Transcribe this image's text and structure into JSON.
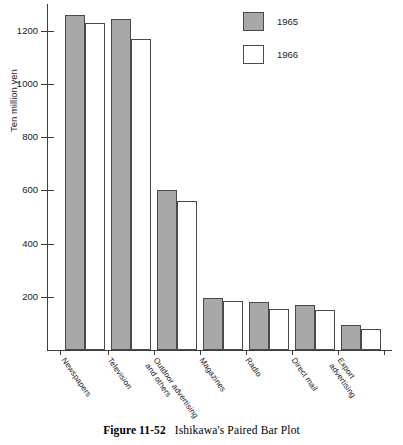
{
  "chart_data": {
    "type": "bar",
    "title": "",
    "xlabel": "",
    "ylabel": "Ten million yen",
    "ylim": [
      0,
      1300
    ],
    "grid": false,
    "legend_position": "top-right",
    "y_ticks": [
      200,
      400,
      600,
      800,
      1000,
      1200
    ],
    "categories": [
      "Newspapers",
      "Television",
      "Outdoor advertising\nand others",
      "Magazines",
      "Radio",
      "Direct mail",
      "Export advertising"
    ],
    "series": [
      {
        "name": "1965",
        "color": "#a8a8a8",
        "values": [
          1260,
          1245,
          600,
          195,
          180,
          170,
          95
        ]
      },
      {
        "name": "1966",
        "color": "#ffffff",
        "values": [
          1230,
          1170,
          560,
          185,
          155,
          152,
          80
        ]
      }
    ]
  },
  "legend": {
    "items": [
      {
        "label": "1965",
        "swatch": "filled-gray-swatch"
      },
      {
        "label": "1966",
        "swatch": "empty-white-swatch"
      }
    ]
  },
  "caption": {
    "number": "Figure 11-52",
    "title": "Ishikawa's Paired Bar Plot"
  }
}
